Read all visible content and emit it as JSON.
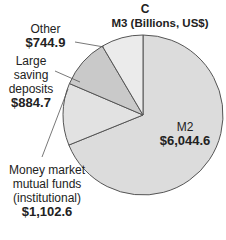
{
  "chart_data": {
    "type": "pie",
    "panel_letter": "C",
    "title": "M3 (Billions, US$)",
    "categories": [
      "M2",
      "Money market mutual funds (institutional)",
      "Large saving deposits",
      "Other"
    ],
    "values": [
      6044.6,
      1102.6,
      884.7,
      744.9
    ],
    "value_labels": [
      "$6,044.6",
      "$1,102.6",
      "$884.7",
      "$744.9"
    ],
    "colors": [
      "#dcdcdc",
      "#e2e2e2",
      "#c9c9c9",
      "#ebebeb"
    ],
    "legend": "none (direct labels)"
  },
  "labels": {
    "m2": {
      "name": "M2",
      "value": "$6,044.6"
    },
    "mmmf": {
      "line1": "Money market",
      "line2": "mutual funds",
      "line3": "(institutional)",
      "value": "$1,102.6"
    },
    "lsd": {
      "line1": "Large",
      "line2": "saving",
      "line3": "deposits",
      "value": "$884.7"
    },
    "other": {
      "name": "Other",
      "value": "$744.9"
    }
  }
}
